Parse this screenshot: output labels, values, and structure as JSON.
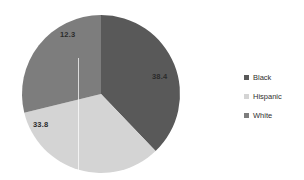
{
  "chart_data": {
    "type": "pie",
    "title": "",
    "subtitle": "",
    "xlabel": "",
    "ylabel": "",
    "grid": false,
    "legend_position": "right",
    "start_angle_deg": 0,
    "direction": "clockwise",
    "categories": [
      "Black",
      "Hispanic",
      "White"
    ],
    "values": [
      38.4,
      33.8,
      12.3
    ],
    "data_labels": [
      "38.4",
      "33.8",
      "12.3"
    ],
    "colors": [
      "#595959",
      "#d4d4d4",
      "#7d7d7d"
    ],
    "slices": [
      {
        "name": "Black",
        "value": 38.4,
        "label": "38.4",
        "color": "#595959",
        "start_deg": 0,
        "end_deg": 136.3,
        "label_x": 152,
        "label_y": 73
      },
      {
        "name": "Hispanic",
        "value": 33.8,
        "label": "33.8",
        "color": "#d4d4d4",
        "start_deg": 136.3,
        "end_deg": 256.2,
        "label_x": 33,
        "label_y": 121
      },
      {
        "name": "White",
        "value": 12.3,
        "label": "12.3",
        "color": "#7d7d7d",
        "start_deg": 256.2,
        "end_deg": 360,
        "label_x": 60,
        "label_y": 31
      }
    ]
  },
  "legend": {
    "items": [
      {
        "label": "Black",
        "color": "#595959"
      },
      {
        "label": "Hispanic",
        "color": "#d4d4d4"
      },
      {
        "label": "White",
        "color": "#7d7d7d"
      }
    ]
  }
}
